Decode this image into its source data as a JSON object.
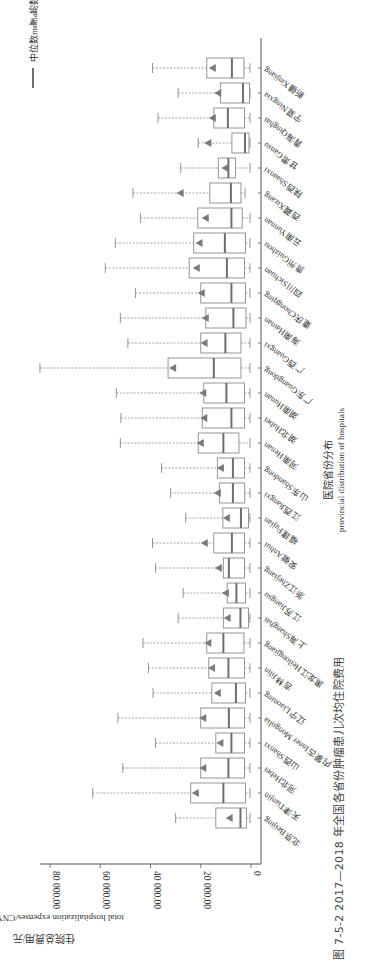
{
  "figure": {
    "caption": "图 7-5-2   2017—2018 年全国各省份肿瘤患儿次均住院费用",
    "orientation": "rotated-90-clockwise"
  },
  "legend": {
    "median_label": "中位数median",
    "mean_label": "均数mean",
    "median_symbol": "line",
    "mean_symbol": "triangle"
  },
  "axes": {
    "value_axis_title_cn": "住院总费用/元",
    "value_axis_title_en": "total hospitalization expenses/CNY",
    "category_axis_title_cn": "医院省份分布",
    "category_axis_title_en": "provincial distribution of hospitals",
    "ticks": [
      "0",
      "20 000.00",
      "40 000.00",
      "60 000.00",
      "80 000.00"
    ]
  },
  "colors": {
    "box_stroke": "#8a8a8a",
    "median": "#6e6e6e",
    "mean": "#7a7a7a",
    "whisker": "#8a8a8a",
    "axis": "#555555",
    "text": "#333333"
  },
  "chart_data": {
    "type": "boxplot",
    "title": "2017—2018 年全国各省份肿瘤患儿次均住院费用",
    "xlabel": "医院省份分布 provincial distribution of hospitals",
    "ylabel": "住院总费用/元 total hospitalization expenses/CNY",
    "ylim": [
      0,
      80000
    ],
    "yticks": [
      0,
      20000,
      40000,
      60000,
      80000
    ],
    "grid": false,
    "legend": [
      "中位数median",
      "均数mean"
    ],
    "legend_position": "top-right (rotated)",
    "categories": [
      "北京Beijing",
      "天津Tianjin",
      "河北Hebei",
      "山西Shanxi",
      "内蒙古Inner Mongolia",
      "辽宁Liaoning",
      "吉林Jilin",
      "黑龙江Heilongjiang",
      "上海Shanghai",
      "江苏Jiangsu",
      "浙江Zhejiang",
      "安徽Anhui",
      "福建Fujian",
      "江西Jiangxi",
      "山东Shandong",
      "河南Henan",
      "湖北Hubei",
      "湖南Hunan",
      "广东Guangdong",
      "广西Guangxi",
      "海南Hainan",
      "重庆Chongqing",
      "四川Sichuan",
      "贵州Guizhou",
      "云南Yunnan",
      "西藏Xizang",
      "陕西Shaanxi",
      "甘肃Gansu",
      "青海Qinghai",
      "宁夏Ningxia",
      "新疆Xinjiang"
    ],
    "series": [
      {
        "name": "min",
        "values": [
          400,
          400,
          400,
          400,
          400,
          400,
          400,
          400,
          400,
          400,
          400,
          400,
          400,
          400,
          400,
          400,
          400,
          400,
          400,
          400,
          400,
          400,
          400,
          400,
          400,
          2400,
          400,
          400,
          400,
          400,
          400
        ]
      },
      {
        "name": "q1",
        "values": [
          1800,
          2200,
          2600,
          2600,
          2600,
          2200,
          2600,
          2800,
          1000,
          2200,
          2600,
          2600,
          1000,
          2500,
          2600,
          4800,
          2600,
          2600,
          4000,
          4000,
          2000,
          2200,
          2600,
          2200,
          3500,
          4000,
          6200,
          800,
          2600,
          600,
          2800
        ]
      },
      {
        "name": "median",
        "values": [
          4200,
          11000,
          9000,
          7800,
          8800,
          6000,
          9000,
          11000,
          4200,
          5800,
          8800,
          7600,
          4000,
          7200,
          7200,
          11000,
          7800,
          9800,
          14800,
          10200,
          7000,
          7800,
          9600,
          10400,
          7800,
          8000,
          9000,
          2400,
          9200,
          3200,
          7600
        ]
      },
      {
        "name": "q3",
        "values": [
          14000,
          24000,
          20000,
          14000,
          20000,
          15600,
          16800,
          17600,
          11000,
          9500,
          11000,
          14800,
          11200,
          12600,
          13400,
          21000,
          19400,
          18800,
          33000,
          20000,
          18000,
          20000,
          24600,
          22800,
          21200,
          16400,
          13000,
          7600,
          14800,
          12200,
          17600
        ]
      },
      {
        "name": "max",
        "values": [
          30000,
          63000,
          51000,
          38000,
          53000,
          39000,
          40800,
          43000,
          29000,
          27000,
          38000,
          39200,
          26000,
          32000,
          35600,
          52000,
          51800,
          53600,
          84000,
          49000,
          52000,
          46000,
          58000,
          54000,
          44000,
          47000,
          28000,
          21000,
          37000,
          29000,
          39200
        ]
      },
      {
        "name": "mean",
        "values": [
          8500,
          22000,
          19000,
          12200,
          19000,
          13200,
          15500,
          17000,
          9300,
          10000,
          12800,
          18400,
          9600,
          13200,
          12000,
          20000,
          18600,
          19000,
          31000,
          18500,
          18000,
          19600,
          21600,
          20500,
          18000,
          28000,
          10200,
          17000,
          15200,
          13000,
          15200
        ]
      }
    ]
  }
}
